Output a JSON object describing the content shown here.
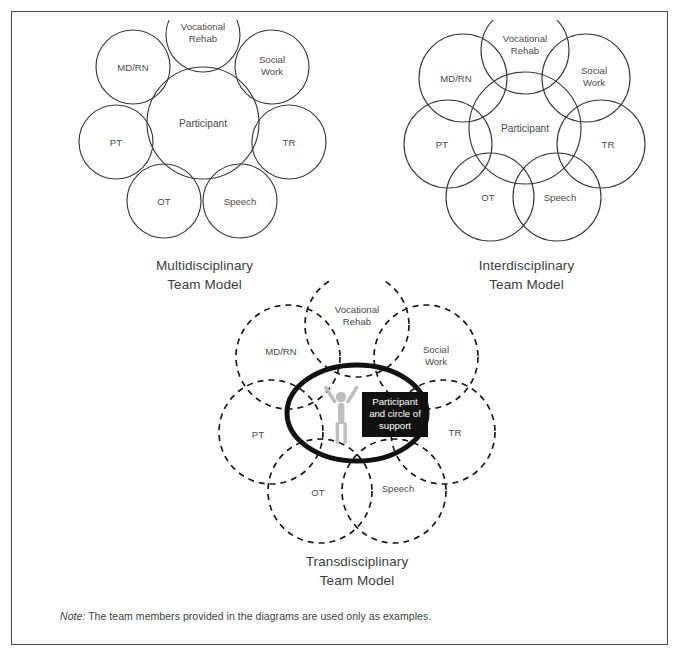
{
  "figure": {
    "note_label": "Note:",
    "note_text": " The team members provided in the diagrams are used only as examples."
  },
  "diagrams": [
    {
      "id": "multidisciplinary",
      "caption_line1": "Multidisciplinary",
      "caption_line2": "Team Model",
      "style": "solid-touching",
      "center": {
        "label": "Participant"
      },
      "nodes": [
        {
          "label_line1": "Vocational",
          "label_line2": "Rehab"
        },
        {
          "label_line1": "Social",
          "label_line2": "Work"
        },
        {
          "label_line1": "TR",
          "label_line2": ""
        },
        {
          "label_line1": "Speech",
          "label_line2": ""
        },
        {
          "label_line1": "OT",
          "label_line2": ""
        },
        {
          "label_line1": "PT",
          "label_line2": ""
        },
        {
          "label_line1": "MD/RN",
          "label_line2": ""
        }
      ]
    },
    {
      "id": "interdisciplinary",
      "caption_line1": "Interdisciplinary",
      "caption_line2": "Team Model",
      "style": "solid-overlapping",
      "center": {
        "label": "Participant"
      },
      "nodes": [
        {
          "label_line1": "Vocational",
          "label_line2": "Rehab"
        },
        {
          "label_line1": "Social",
          "label_line2": "Work"
        },
        {
          "label_line1": "TR",
          "label_line2": ""
        },
        {
          "label_line1": "Speech",
          "label_line2": ""
        },
        {
          "label_line1": "OT",
          "label_line2": ""
        },
        {
          "label_line1": "PT",
          "label_line2": ""
        },
        {
          "label_line1": "MD/RN",
          "label_line2": ""
        }
      ]
    },
    {
      "id": "transdisciplinary",
      "caption_line1": "Transdisciplinary",
      "caption_line2": "Team Model",
      "style": "dashed-overlapping",
      "center": {
        "box_line1": "Participant",
        "box_line2": "and circle of",
        "box_line3": "support"
      },
      "nodes": [
        {
          "label_line1": "Vocational",
          "label_line2": "Rehab"
        },
        {
          "label_line1": "Social",
          "label_line2": "Work"
        },
        {
          "label_line1": "TR",
          "label_line2": ""
        },
        {
          "label_line1": "Speech",
          "label_line2": ""
        },
        {
          "label_line1": "OT",
          "label_line2": ""
        },
        {
          "label_line1": "PT",
          "label_line2": ""
        },
        {
          "label_line1": "MD/RN",
          "label_line2": ""
        }
      ]
    }
  ],
  "colors": {
    "frame_border": "#4a4a4a",
    "ring_solid": "#3a3a3a",
    "ring_dashed": "#1a1a1a",
    "core_ellipse": "#111111",
    "label_box_fill": "#111111",
    "label_box_text": "#ffffff",
    "person_figure": "#bfbfbf",
    "text": "#3d3d3d",
    "background": "#ffffff"
  }
}
